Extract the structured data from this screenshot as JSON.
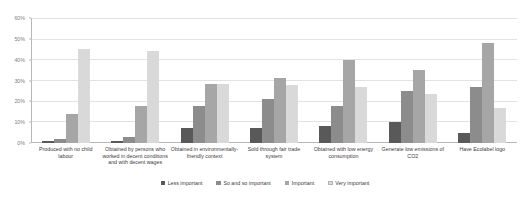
{
  "chart_data": {
    "type": "bar",
    "title": "",
    "subtitle": "",
    "xlabel": "",
    "ylabel": "",
    "ylim": [
      0,
      60
    ],
    "ytick_labels": [
      "0%",
      "10%",
      "20%",
      "30%",
      "40%",
      "50%",
      "60%"
    ],
    "ytick_values": [
      0,
      10,
      20,
      30,
      40,
      50,
      60
    ],
    "grid": true,
    "legend_position": "bottom",
    "categories": [
      "Produced with no child labour",
      "Obtained by persons who worked in decent conditions and with decent wages",
      "Obtained in environmentally-friendly context",
      "Sold through fair trade system",
      "Obtained with low energy consumption",
      "Generate low emissions of CO2",
      "Have Ecolabel logo"
    ],
    "series": [
      {
        "name": "Less important",
        "color": "#595959",
        "values": [
          1,
          1,
          7,
          7,
          8,
          10,
          5
        ]
      },
      {
        "name": "So and so important",
        "color": "#8c8c8c",
        "values": [
          2,
          3,
          18,
          21,
          18,
          25,
          27
        ]
      },
      {
        "name": "Important",
        "color": "#a6a6a6",
        "values": [
          14,
          18,
          28.5,
          31,
          40,
          35,
          48
        ]
      },
      {
        "name": "Very important",
        "color": "#d9d9d9",
        "values": [
          45,
          44,
          28.5,
          28,
          27,
          23.5,
          17
        ]
      }
    ]
  },
  "axis": {
    "y": {
      "t0": "0%",
      "t1": "10%",
      "t2": "20%",
      "t3": "30%",
      "t4": "40%",
      "t5": "50%",
      "t6": "60%"
    }
  },
  "legend": {
    "items": [
      {
        "label": "Less important"
      },
      {
        "label": "So and so important"
      },
      {
        "label": "Important"
      },
      {
        "label": "Very important"
      }
    ]
  }
}
